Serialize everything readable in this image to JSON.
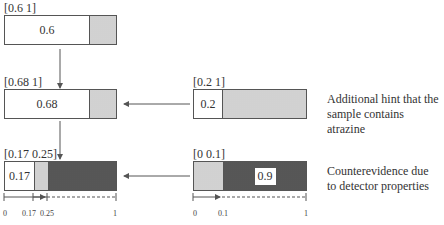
{
  "diagram": {
    "left_column": {
      "box1": {
        "interval_label": "[0.6  1]",
        "value_label": "0.6",
        "segments": [
          0.6,
          0.4
        ]
      },
      "box2": {
        "interval_label": "[0.68  1]",
        "value_label": "0.68",
        "segments": [
          0.68,
          0.32
        ]
      },
      "box3": {
        "interval_label": "[0.17  0.25]",
        "value_label": "0.17",
        "segments": [
          0.17,
          0.08,
          0.75
        ]
      }
    },
    "right_column": {
      "box1": {
        "interval_label": "[0.2  1]",
        "value_label": "0.2",
        "segments": [
          0.2,
          0.8
        ]
      },
      "box2": {
        "interval_label": "[0  0.1]",
        "value_label": "0.9",
        "segments": [
          0.1,
          0.9
        ]
      }
    },
    "notes": {
      "hint": [
        "Additional hint that the",
        "sample contains atrazine"
      ],
      "counter": [
        "Counterevidence due",
        "to detector properties"
      ]
    },
    "scales": {
      "left": {
        "ticks": [
          "0",
          "0.17",
          "0.25",
          "1"
        ]
      },
      "right": {
        "ticks": [
          "0",
          "0.1",
          "1"
        ]
      }
    },
    "colors": {
      "line": "#555555",
      "light_fill": "#e0e0e0",
      "dark_fill": "#3a3a3a"
    }
  }
}
